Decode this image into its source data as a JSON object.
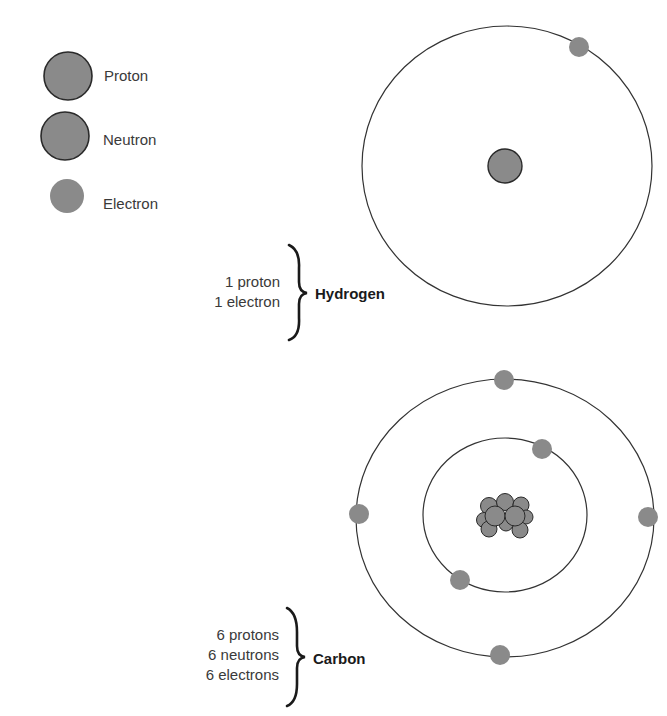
{
  "legend": {
    "items": [
      {
        "label": "Proton",
        "type": "proton"
      },
      {
        "label": "Neutron",
        "type": "neutron"
      },
      {
        "label": "Electron",
        "type": "electron"
      }
    ]
  },
  "atoms": [
    {
      "name": "Hydrogen",
      "counts": [
        "1 proton",
        "1 electron"
      ],
      "protons": 1,
      "neutrons": 0,
      "electrons": 1,
      "shells": [
        1
      ]
    },
    {
      "name": "Carbon",
      "counts": [
        "6 protons",
        "6 neutrons",
        "6 electrons"
      ],
      "protons": 6,
      "neutrons": 6,
      "electrons": 6,
      "shells": [
        2,
        4
      ]
    }
  ],
  "colors": {
    "particle_fill": "#8a8a8a",
    "particle_stroke": "#2a2a2a",
    "orbit_stroke": "#333333",
    "text": "#3a3a3a"
  }
}
